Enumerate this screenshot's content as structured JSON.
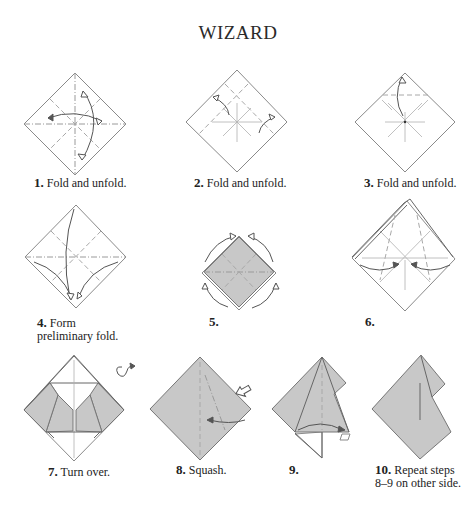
{
  "title": "WIZARD",
  "steps": [
    {
      "number": "1.",
      "text": "Fold and unfold."
    },
    {
      "number": "2.",
      "text": "Fold and unfold."
    },
    {
      "number": "3.",
      "text": "Fold and unfold."
    },
    {
      "number": "4.",
      "text": "Form",
      "text2": "preliminary fold."
    },
    {
      "number": "5.",
      "text": ""
    },
    {
      "number": "6.",
      "text": ""
    },
    {
      "number": "7.",
      "text": "Turn over."
    },
    {
      "number": "8.",
      "text": "Squash."
    },
    {
      "number": "9.",
      "text": ""
    },
    {
      "number": "10.",
      "text": "Repeat steps",
      "text2": "8–9 on other side."
    }
  ],
  "colors": {
    "paper_white": "#ffffff",
    "paper_colored": "#c8c8c8",
    "line": "#8a8a8a"
  }
}
